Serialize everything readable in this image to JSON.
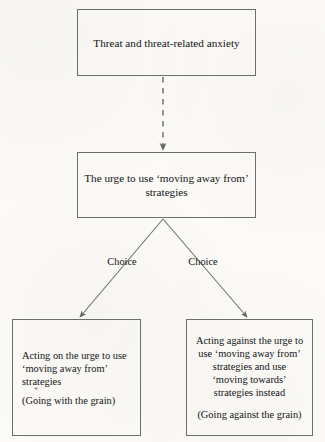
{
  "diagram": {
    "background_color": "#fbfaf7",
    "stroke_color": "#6d6d6d",
    "text_color": "#141414",
    "nodes": {
      "threat": {
        "label": "Threat and threat-related anxiety",
        "lines": [
          "Threat and threat-related anxiety"
        ]
      },
      "urge": {
        "label": "The urge to use ‘moving away from’ strategies",
        "lines": [
          "The urge to use ‘moving away from’",
          "strategies"
        ]
      },
      "acting_on": {
        "label": "Acting on the urge to use ‘moving away from’ strategies (Going with the grain)",
        "lines": [
          "Acting on the urge to use",
          "‘moving away from’",
          "strategies"
        ],
        "artifact": "*",
        "parenthetical": "(Going with the grain)"
      },
      "acting_against": {
        "label": "Acting against the urge to use ‘moving away from’ strategies and use ‘moving towards’ strategies instead (Going against the grain)",
        "lines": [
          "Acting against the urge to",
          "use ‘moving away from’",
          "strategies and use",
          "‘moving towards’",
          "strategies instead"
        ],
        "parenthetical": "(Going against the grain)"
      }
    },
    "edges": {
      "threat_to_urge": {
        "style": "dashed",
        "arrowhead": "filled-triangle",
        "label": ""
      },
      "urge_to_acting_on": {
        "style": "solid",
        "arrowhead": "filled-triangle",
        "label": "Choice"
      },
      "urge_to_acting_against": {
        "style": "solid",
        "arrowhead": "filled-triangle",
        "label": "Choice"
      }
    }
  }
}
